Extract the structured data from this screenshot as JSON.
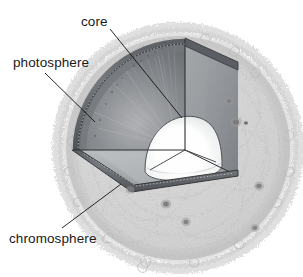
{
  "figure": {
    "background_color": "#ffffff",
    "style": "grayscale pencil illustration"
  },
  "labels": {
    "core": "core",
    "photosphere": "photosphere",
    "chromosphere": "chromosphere"
  },
  "colors": {
    "text": "#1a1a1a",
    "leader_line": "#111111",
    "chromosphere_light": "#e8e8e8",
    "chromosphere_mid": "#cfcfcf",
    "chromosphere_dark": "#a8a8a8",
    "interior_dark": "#6f7276",
    "interior_mid": "#8e9195",
    "interior_light": "#c6c8ca",
    "rim_dark": "#4a4c50",
    "core_bright": "#fbfbfb",
    "sunspot": "#4a4a4a"
  },
  "structure": {
    "layers": [
      "chromosphere",
      "photosphere",
      "core"
    ],
    "cutaway": "quarter wedge removed from upper-left front",
    "sunspot_count": 8
  }
}
